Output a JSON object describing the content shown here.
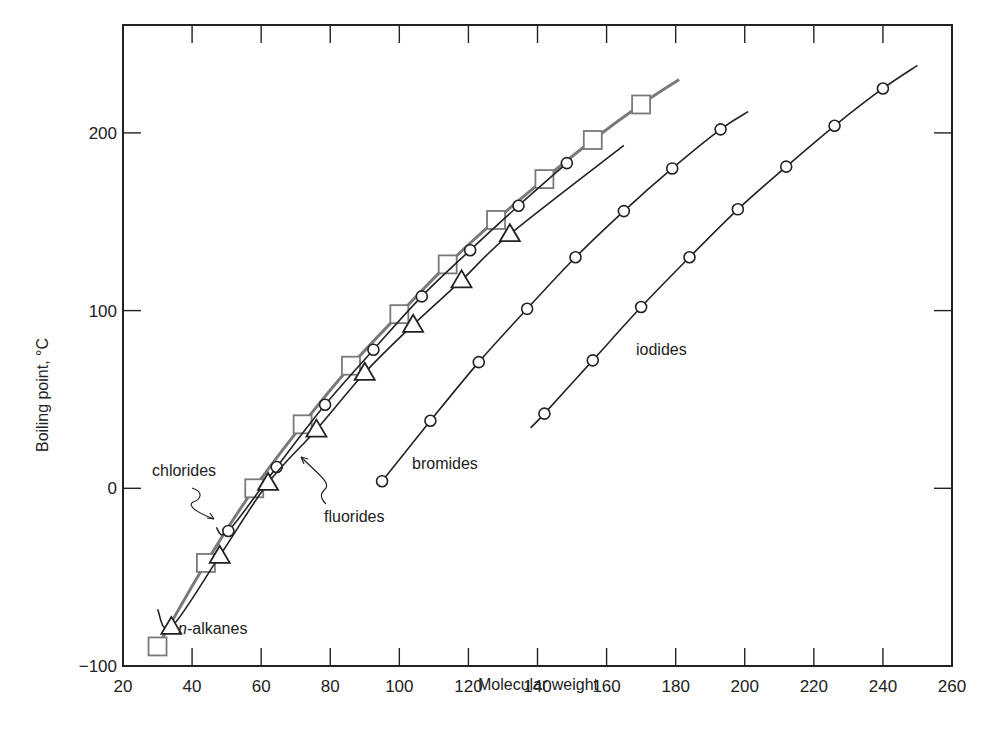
{
  "chart_data": {
    "type": "line",
    "title": "",
    "xlabel": "Molecular weight",
    "ylabel": "Boiling point, °C",
    "xlim": [
      20,
      260
    ],
    "ylim": [
      -100,
      260
    ],
    "xticks": [
      20,
      40,
      60,
      80,
      100,
      120,
      140,
      160,
      180,
      200,
      220,
      240,
      260
    ],
    "yticks": [
      -100,
      0,
      100,
      200
    ],
    "xtick_labels": [
      "20",
      "40",
      "60",
      "80",
      "100",
      "120",
      "140",
      "160",
      "180",
      "200",
      "220",
      "240",
      "260"
    ],
    "ytick_labels": [
      "−100",
      "0",
      "100",
      "200"
    ],
    "grid": false,
    "legend": "none (inline series labels)",
    "series": [
      {
        "name": "n-alkanes",
        "label_prefix": "n",
        "label_suffix": "-alkanes",
        "marker": "square",
        "color": "#7a7a7a",
        "x": [
          30,
          44,
          58,
          72,
          86,
          100,
          114,
          128,
          142,
          156,
          170
        ],
        "y": [
          -89,
          -42,
          0,
          36,
          69,
          98,
          126,
          151,
          174,
          196,
          216
        ],
        "curve_end": [
          181,
          230
        ]
      },
      {
        "name": "chlorides",
        "marker": "circle",
        "color": "#222222",
        "x": [
          50.5,
          64.5,
          78.5,
          92.5,
          106.5,
          120.5,
          134.5,
          148.5
        ],
        "y": [
          -24,
          12,
          47,
          78,
          108,
          134,
          159,
          183
        ],
        "curve_start": [
          47,
          -22
        ],
        "curve_end": [
          149,
          184
        ]
      },
      {
        "name": "fluorides",
        "marker": "triangle",
        "color": "#222222",
        "x": [
          34,
          48,
          62,
          76,
          90,
          104,
          118,
          132
        ],
        "y": [
          -78,
          -38,
          3,
          33,
          65,
          92,
          117,
          143
        ],
        "curve_start": [
          30,
          -68
        ],
        "curve_end": [
          165,
          193
        ]
      },
      {
        "name": "bromides",
        "marker": "circle",
        "color": "#222222",
        "x": [
          95,
          109,
          123,
          137,
          151,
          165,
          179,
          193
        ],
        "y": [
          4,
          38,
          71,
          101,
          130,
          156,
          180,
          202
        ],
        "curve_end": [
          201,
          212
        ]
      },
      {
        "name": "iodides",
        "marker": "circle",
        "color": "#222222",
        "x": [
          142,
          156,
          170,
          184,
          198,
          212,
          226,
          240
        ],
        "y": [
          42,
          72,
          102,
          130,
          157,
          181,
          204,
          225
        ],
        "curve_start": [
          138,
          34
        ],
        "curve_end": [
          250,
          238
        ]
      }
    ]
  },
  "labels": {
    "chlorides": "chlorides",
    "fluorides": "fluorides",
    "bromides": "bromides",
    "iodides": "iodides",
    "alkanes_n": "n",
    "alkanes_rest": "-alkanes",
    "xlabel": "Molecular weight",
    "ylabel": "Boiling point, °C"
  }
}
